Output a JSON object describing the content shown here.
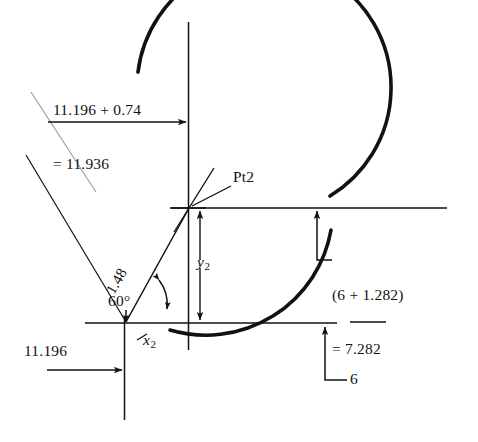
{
  "figure": {
    "type": "engineering-dimension-diagram",
    "stroke_color": "#111111",
    "background": "#ffffff",
    "labels": {
      "dim_top_line1": "11.196 + 0.74",
      "dim_top_line2": "= 11.936",
      "point_label": "Pt2",
      "radius_dim": "1.48",
      "angle": "60°",
      "y_var": "y",
      "y_sub": "2",
      "x_var": "x",
      "x_sub": "2",
      "dim_right_line1": "(6 + 1.282)",
      "dim_right_line2": "= 7.282",
      "dim_bottom_left": "11.196",
      "dim_bottom_right": "6"
    },
    "values": {
      "x_offset_base": "11.196",
      "x_offset_add": "0.74",
      "x_offset_total": "11.936",
      "radius": "1.48",
      "angle_deg": "60",
      "y_base": "6",
      "y_add": "1.282",
      "y_total": "7.282",
      "x_base": "11.196",
      "y_ref": "6"
    }
  }
}
